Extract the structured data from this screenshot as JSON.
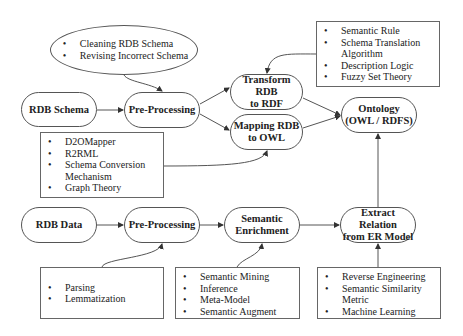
{
  "nodes": {
    "rdb_schema": "RDB Schema",
    "pre_processing_top": "Pre-Processing",
    "transform_rdb_rdf": [
      "Transform RDB",
      "to RDF"
    ],
    "mapping_rdb_owl": [
      "Mapping RDB",
      "to OWL"
    ],
    "ontology": [
      "Ontology",
      "(OWL / RDFS)"
    ],
    "rdb_data": "RDB Data",
    "pre_processing_bottom": "Pre-Processing",
    "semantic_enrichment": [
      "Semantic",
      "Enrichment"
    ],
    "extract_relation": [
      "Extract Relation",
      "from ER Model"
    ]
  },
  "annotations": {
    "schema_preprocessing": [
      "Cleaning RDB Schema",
      "Revising Incorrect Schema"
    ],
    "transform_methods": [
      "Semantic Rule",
      "Schema Translation Algorithm",
      "Description Logic",
      "Fuzzy Set Theory"
    ],
    "mapping_methods": [
      "D2OMapper",
      "R2RML",
      "Schema Conversion Mechanism",
      "Graph Theory"
    ],
    "data_preprocessing": [
      "Parsing",
      "Lemmatization"
    ],
    "enrichment_methods": [
      "Semantic Mining",
      "Inference",
      "Meta-Model",
      "Semantic Augment"
    ],
    "extraction_methods": [
      "Reverse Engineering",
      "Semantic Similarity Metric",
      "Machine Learning"
    ]
  }
}
